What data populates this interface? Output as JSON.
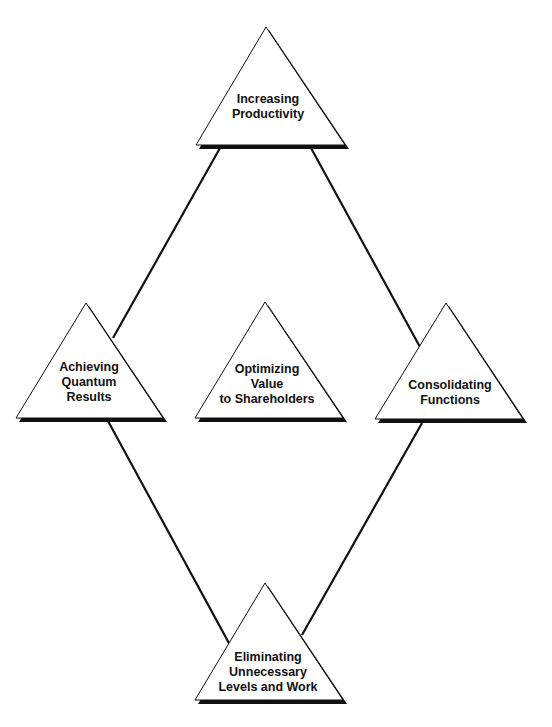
{
  "diagram": {
    "type": "diamond-of-triangles",
    "colors": {
      "stroke": "#111111",
      "fill": "#ffffff",
      "shadow": "#111111",
      "background": "#ffffff"
    },
    "nodes": [
      {
        "id": "top",
        "lines": [
          "Increasing",
          "Productivity"
        ]
      },
      {
        "id": "left",
        "lines": [
          "Achieving",
          "Quantum",
          "Results"
        ]
      },
      {
        "id": "center",
        "lines": [
          "Optimizing",
          "Value",
          "to Shareholders"
        ]
      },
      {
        "id": "right",
        "lines": [
          "Consolidating",
          "Functions"
        ]
      },
      {
        "id": "bottom",
        "lines": [
          "Eliminating",
          "Unnecessary",
          "Levels and Work"
        ]
      }
    ],
    "edges": [
      {
        "from": "top",
        "to": "left"
      },
      {
        "from": "top",
        "to": "right"
      },
      {
        "from": "left",
        "to": "bottom"
      },
      {
        "from": "right",
        "to": "bottom"
      }
    ]
  }
}
